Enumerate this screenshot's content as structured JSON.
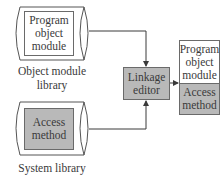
{
  "diagram": {
    "object_library": {
      "label": "Object module library",
      "label_line1": "Object module",
      "label_line2": "library",
      "content": [
        "Program",
        "object",
        "module"
      ]
    },
    "system_library": {
      "label": "System library",
      "content": [
        "Access",
        "method"
      ]
    },
    "linkage_editor": {
      "content": [
        "Linkage",
        "editor"
      ]
    },
    "output_module": {
      "top": [
        "Program",
        "object",
        "module"
      ],
      "bottom": [
        "Access",
        "method"
      ]
    },
    "colors": {
      "gray_fill": "#b9b9b9",
      "line": "#4a4a4a",
      "text": "#3a3a3a"
    },
    "edges": [
      {
        "from": "object_library",
        "to": "linkage_editor"
      },
      {
        "from": "system_library",
        "to": "linkage_editor"
      },
      {
        "from": "linkage_editor",
        "to": "output_module"
      }
    ]
  }
}
